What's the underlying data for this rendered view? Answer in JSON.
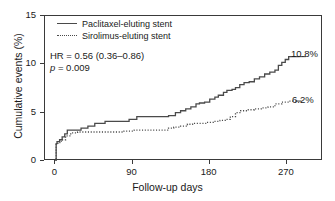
{
  "chart_data": {
    "type": "line",
    "title": "",
    "xlabel": "Follow-up days",
    "ylabel": "Cumulative events (%)",
    "xlim": [
      -12,
      312
    ],
    "ylim": [
      0,
      15
    ],
    "xticks": [
      0,
      90,
      180,
      270
    ],
    "xtick_labels": [
      "0",
      "90",
      "180",
      "270"
    ],
    "yticks": [
      0,
      5,
      10,
      15
    ],
    "ytick_labels": [
      "0",
      "5",
      "10",
      "15"
    ],
    "grid": false,
    "legend_position": "upper-left-inside",
    "series": [
      {
        "name": "Paclitaxel-eluting stent",
        "style": "solid",
        "color": "#4a4a4a",
        "end_label": "10.8%",
        "end_value": 10.8,
        "points": [
          [
            0,
            0
          ],
          [
            1,
            1.8
          ],
          [
            2,
            2.0
          ],
          [
            5,
            2.2
          ],
          [
            8,
            2.5
          ],
          [
            11,
            2.8
          ],
          [
            14,
            3.2
          ],
          [
            22,
            3.2
          ],
          [
            30,
            3.4
          ],
          [
            38,
            3.6
          ],
          [
            46,
            3.9
          ],
          [
            58,
            4.1
          ],
          [
            72,
            4.1
          ],
          [
            86,
            4.3
          ],
          [
            95,
            4.6
          ],
          [
            120,
            4.6
          ],
          [
            132,
            4.7
          ],
          [
            140,
            5.0
          ],
          [
            146,
            5.2
          ],
          [
            152,
            5.4
          ],
          [
            158,
            5.6
          ],
          [
            164,
            5.9
          ],
          [
            168,
            6.0
          ],
          [
            174,
            6.1
          ],
          [
            180,
            6.4
          ],
          [
            186,
            6.6
          ],
          [
            190,
            6.8
          ],
          [
            196,
            7.1
          ],
          [
            200,
            7.3
          ],
          [
            206,
            7.4
          ],
          [
            210,
            7.6
          ],
          [
            215,
            7.9
          ],
          [
            220,
            8.1
          ],
          [
            226,
            8.2
          ],
          [
            232,
            8.5
          ],
          [
            238,
            8.7
          ],
          [
            244,
            9.0
          ],
          [
            250,
            9.2
          ],
          [
            256,
            9.4
          ],
          [
            260,
            9.9
          ],
          [
            264,
            10.2
          ],
          [
            268,
            10.5
          ],
          [
            272,
            10.8
          ],
          [
            285,
            10.8
          ]
        ]
      },
      {
        "name": "Sirolimus-eluting stent",
        "style": "dotted",
        "color": "#4a4a4a",
        "end_label": "6.2%",
        "end_value": 6.2,
        "points": [
          [
            0,
            0
          ],
          [
            1,
            1.7
          ],
          [
            3,
            1.9
          ],
          [
            7,
            2.2
          ],
          [
            12,
            2.6
          ],
          [
            18,
            2.9
          ],
          [
            26,
            3.0
          ],
          [
            40,
            3.0
          ],
          [
            60,
            3.0
          ],
          [
            80,
            3.1
          ],
          [
            92,
            3.2
          ],
          [
            110,
            3.2
          ],
          [
            124,
            3.2
          ],
          [
            132,
            3.4
          ],
          [
            138,
            3.5
          ],
          [
            146,
            3.6
          ],
          [
            154,
            3.8
          ],
          [
            160,
            3.9
          ],
          [
            168,
            3.9
          ],
          [
            176,
            4.0
          ],
          [
            184,
            4.1
          ],
          [
            192,
            4.2
          ],
          [
            198,
            4.3
          ],
          [
            204,
            4.6
          ],
          [
            210,
            5.0
          ],
          [
            216,
            5.2
          ],
          [
            224,
            5.3
          ],
          [
            232,
            5.4
          ],
          [
            240,
            5.5
          ],
          [
            248,
            5.6
          ],
          [
            256,
            5.9
          ],
          [
            264,
            6.1
          ],
          [
            272,
            6.2
          ],
          [
            280,
            6.2
          ]
        ]
      }
    ],
    "annotations": [
      {
        "name": "hazard-ratio",
        "text": "HR = 0.56 (0.36–0.86)"
      },
      {
        "name": "p-value",
        "italic_prefix": "p",
        "text": " = 0.009"
      }
    ]
  },
  "legend": {
    "items": [
      {
        "label": "Paclitaxel-eluting stent",
        "style": "solid"
      },
      {
        "label": "Sirolimus-eluting stent",
        "style": "dotted"
      }
    ]
  },
  "colors": {
    "line": "#4a4a4a",
    "axis": "#3a3a3a",
    "text": "#1a1a1a",
    "background": "#ffffff"
  }
}
